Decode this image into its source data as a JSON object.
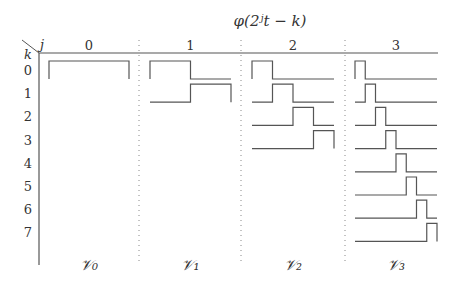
{
  "title": "φ(2ʲt − k)",
  "axis": {
    "j_label": "j",
    "k_label": "k"
  },
  "columns": [
    {
      "j": "0",
      "space_label": "𝒱₀",
      "x0": 49,
      "x1": 129,
      "pulses": 1
    },
    {
      "j": "1",
      "space_label": "𝒱₁",
      "x0": 150,
      "x1": 231,
      "pulses": 2
    },
    {
      "j": "2",
      "space_label": "𝒱₂",
      "x0": 252,
      "x1": 334,
      "pulses": 4
    },
    {
      "j": "3",
      "space_label": "𝒱₃",
      "x0": 355,
      "x1": 437,
      "pulses": 8
    }
  ],
  "rows": [
    "0",
    "1",
    "2",
    "3",
    "4",
    "5",
    "6",
    "7"
  ],
  "colors": {
    "line": "#555555",
    "text": "#333333",
    "dotted": "#888888"
  }
}
